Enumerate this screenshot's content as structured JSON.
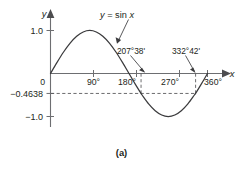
{
  "figure": {
    "caption": "(a)",
    "curve_label": "y = sin x",
    "curve_label_parts": {
      "lhs": "y",
      "eq": " = sin ",
      "rhs": "x"
    },
    "axis_label_y": "y",
    "axis_label_x": "x"
  },
  "chart_data": {
    "type": "line",
    "title": "",
    "subtitle": "",
    "xlabel": "x",
    "ylabel": "y",
    "xlim": [
      0,
      390
    ],
    "ylim": [
      -1.25,
      1.25
    ],
    "grid": false,
    "legend_position": "inline-annotation",
    "series": [
      {
        "name": "y = sin x",
        "x": [
          0,
          15,
          30,
          45,
          60,
          75,
          90,
          105,
          120,
          135,
          150,
          165,
          180,
          195,
          207.633,
          210,
          225,
          240,
          255,
          270,
          285,
          300,
          315,
          330,
          332.7,
          345,
          360
        ],
        "values": [
          0,
          0.2588,
          0.5,
          0.7071,
          0.866,
          0.9659,
          1.0,
          0.9659,
          0.866,
          0.7071,
          0.5,
          0.2588,
          0,
          -0.2588,
          -0.4638,
          -0.5,
          -0.7071,
          -0.866,
          -0.9659,
          -1.0,
          -0.9659,
          -0.866,
          -0.7071,
          -0.5,
          -0.4638,
          -0.2588,
          0
        ]
      }
    ],
    "x_ticks": [
      0,
      90,
      180,
      270,
      360
    ],
    "x_tick_labels": [
      "0",
      "90°",
      "180°",
      "270°",
      "360°"
    ],
    "y_ticks": [
      1.0,
      -0.4638,
      -1.0
    ],
    "y_tick_labels": [
      "1.0",
      "−0.4638",
      "−1.0"
    ],
    "reference_lines": [
      {
        "name": "y-level",
        "orientation": "horizontal",
        "value": -0.4638,
        "label": "−0.4638",
        "style": "dashed"
      },
      {
        "name": "root-1",
        "orientation": "vertical",
        "value": 207.633,
        "label": "207°38'",
        "style": "dashed"
      },
      {
        "name": "root-2",
        "orientation": "vertical",
        "value": 332.7,
        "label": "332°42'",
        "style": "dashed"
      }
    ],
    "annotations": [
      {
        "name": "solution-1",
        "text": "207°38'",
        "x": 207.633,
        "y": 0
      },
      {
        "name": "solution-2",
        "text": "332°42'",
        "x": 332.7,
        "y": 0
      },
      {
        "name": "curve-label",
        "text": "y = sin x",
        "x": 120,
        "y": 1.15
      }
    ],
    "colors": {
      "curve": "#3b3b3d",
      "axis": "#6d6e71",
      "dash": "#5b5b5d",
      "text": "#231f20",
      "background": "#ffffff"
    }
  },
  "labels": {
    "y_axis": "y",
    "x_axis": "x",
    "tick_1_0": "1.0",
    "tick_0": "0",
    "tick_90": "90°",
    "tick_180": "180°",
    "tick_270": "270°",
    "tick_360": "360°",
    "tick_neg_1_0": "−1.0",
    "tick_neg_04638": "−0.4638",
    "annot_207": "207°38'",
    "annot_332": "332°42'"
  }
}
